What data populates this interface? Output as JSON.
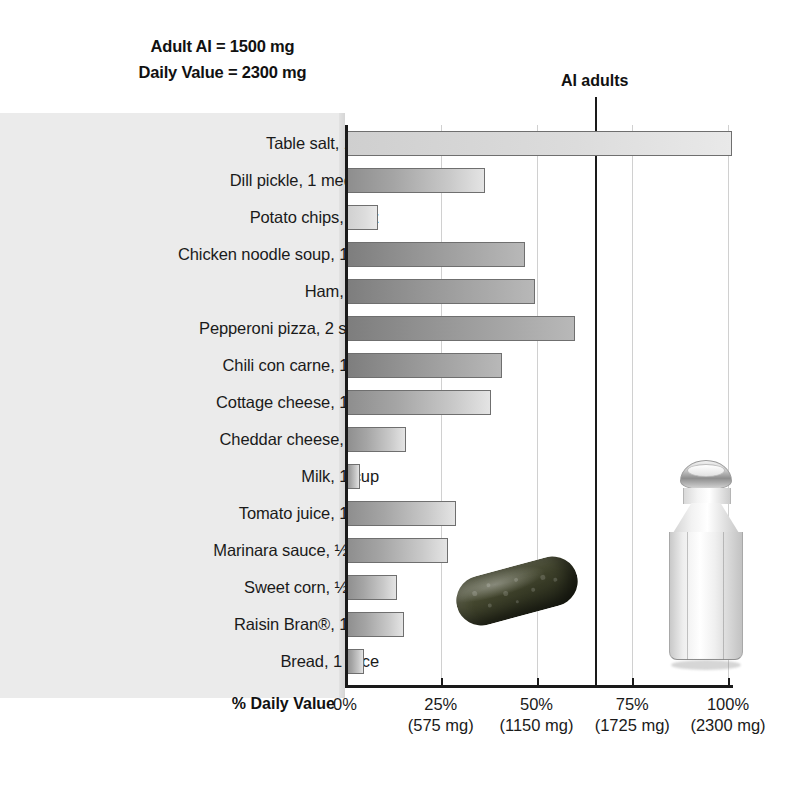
{
  "header_note": {
    "line1": "Adult AI = 1500 mg",
    "line2": "Daily Value = 2300 mg"
  },
  "annotation": {
    "ai_adults_label": "AI adults"
  },
  "axis": {
    "xlabel": "% Daily Value",
    "ticks": [
      {
        "pct": "0%",
        "mg": ""
      },
      {
        "pct": "25%",
        "mg": "(575 mg)"
      },
      {
        "pct": "50%",
        "mg": "(1150 mg)"
      },
      {
        "pct": "75%",
        "mg": "(1725 mg)"
      },
      {
        "pct": "100%",
        "mg": "(2300 mg)"
      }
    ]
  },
  "chart_data": {
    "type": "bar",
    "orientation": "horizontal",
    "title": "",
    "xlabel": "% Daily Value",
    "ylabel": "",
    "xlim": [
      0,
      105
    ],
    "grid": true,
    "legend": false,
    "annotations": [
      {
        "label": "AI adults",
        "type": "vline",
        "value": 65.2,
        "note": "Adult AI = 1500 mg of 2300 mg Daily Value"
      }
    ],
    "axis_secondary_ticks": [
      "",
      "575 mg",
      "1150 mg",
      "1725 mg",
      "2300 mg"
    ],
    "categories": [
      "Table salt, 1 tsp",
      "Dill pickle, 1 medium",
      "Potato chips, 1 oz",
      "Chicken noodle soup, 1 cup",
      "Ham, 3 oz",
      "Pepperoni pizza, 2 slices",
      "Chili con carne, 1 cup",
      "Cottage cheese, 1 cup",
      "Cheddar cheese, 2 oz",
      "Milk, 1 cup",
      "Tomato juice, 1 cup",
      "Marinara sauce, ½ cup",
      "Sweet corn, ½ cup",
      "Raisin Bran®, 1 cup",
      "Bread, 1 slice"
    ],
    "values": [
      101,
      36.5,
      8.5,
      47,
      49.5,
      60,
      41,
      38,
      16,
      4,
      29,
      27,
      13.5,
      15.5,
      5
    ],
    "shades": [
      "light",
      "mid",
      "light",
      "dark",
      "dark",
      "dark",
      "dark",
      "mid",
      "mid",
      "mid",
      "mid",
      "mid",
      "mid",
      "mid",
      "mid"
    ]
  },
  "photos": [
    {
      "name": "dill-pickle-photo"
    },
    {
      "name": "salt-shaker-photo"
    }
  ]
}
